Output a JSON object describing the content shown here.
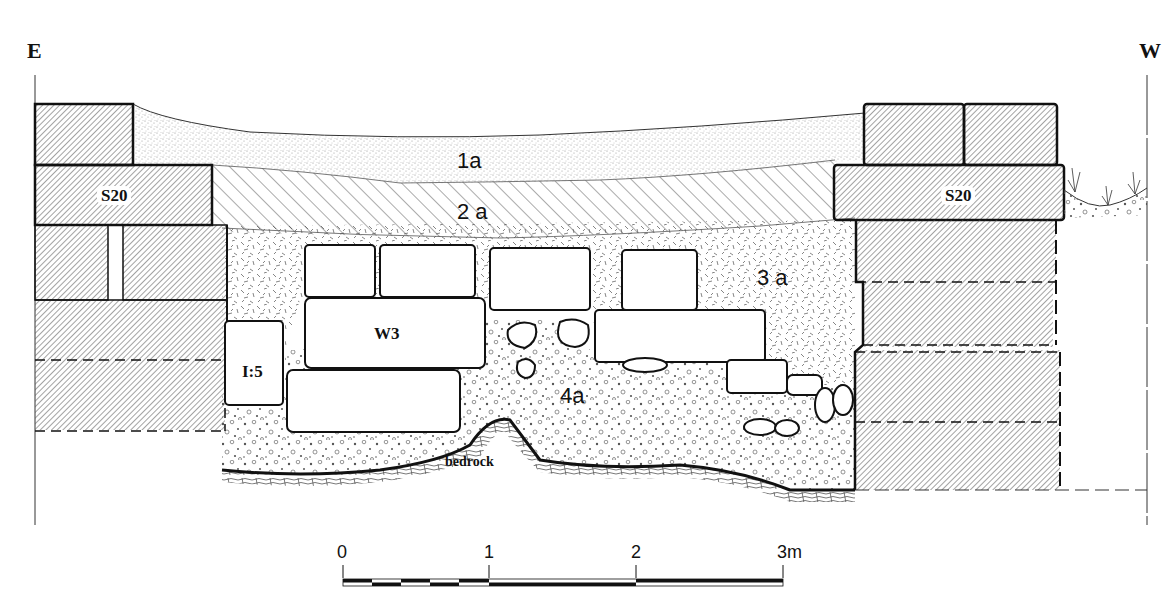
{
  "orientation": {
    "left": "E",
    "right": "W"
  },
  "layers": [
    {
      "id": "1a",
      "label": "1a",
      "fill": "fine-stipple"
    },
    {
      "id": "2a",
      "label": "2 a",
      "fill": "diagonal-hatch"
    },
    {
      "id": "3a",
      "label": "3 a",
      "fill": "dash-texture"
    },
    {
      "id": "4a",
      "label": "4a",
      "fill": "pebble-stipple"
    }
  ],
  "features": {
    "wall_left": "S20",
    "wall_right": "S20",
    "wall_center": "W3",
    "stone_left": "I:5",
    "bedrock": "bedrock"
  },
  "scale_bar": {
    "ticks": [
      "0",
      "1",
      "2",
      "3m"
    ],
    "unit": "m"
  },
  "colors": {
    "ink": "#111111",
    "paper": "#ffffff",
    "hatch": "#555555"
  }
}
